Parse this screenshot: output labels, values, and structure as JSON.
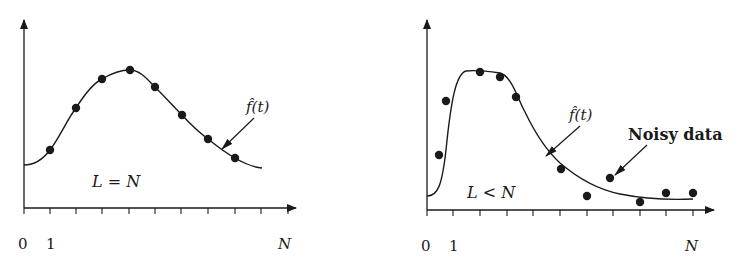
{
  "panels": [
    {
      "id": "left",
      "condition_label": "L = N",
      "curve_label": "f̂(t)",
      "x_ticks": [
        "0",
        "1",
        "N"
      ],
      "description": "Fitted curve passes exactly through all data points"
    },
    {
      "id": "right",
      "condition_label": "L < N",
      "curve_label": "f̂(t)",
      "annotation": "Noisy data",
      "x_ticks": [
        "0",
        "1",
        "N"
      ],
      "description": "Smooth fitted curve approximates noisy data points"
    }
  ],
  "colors": {
    "ink": "#1a1a1a",
    "background": "#ffffff"
  }
}
